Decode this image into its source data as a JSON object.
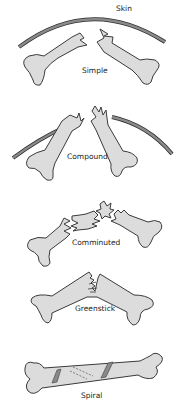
{
  "diagram": {
    "skin_label": "Skin",
    "panels": [
      {
        "id": "simple",
        "label": "Simple"
      },
      {
        "id": "compound",
        "label": "Compound"
      },
      {
        "id": "comminuted",
        "label": "Comminuted"
      },
      {
        "id": "greenstick",
        "label": "Greenstick"
      },
      {
        "id": "spiral",
        "label": "Spiral"
      }
    ],
    "colors": {
      "bone_fill": "#dcdcdc",
      "outline": "#3a3a3a",
      "skin": "#8a8a8a",
      "background": "#ffffff"
    }
  }
}
